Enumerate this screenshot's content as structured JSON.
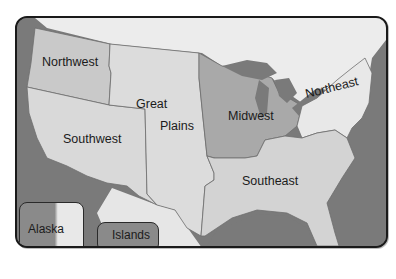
{
  "map": {
    "title": "United States Regions",
    "regions": [
      {
        "name": "Northwest",
        "fill": "#c9c9c9"
      },
      {
        "name": "Great",
        "fill": "#dcdcdc"
      },
      {
        "name": "Plains",
        "fill": "#dcdcdc"
      },
      {
        "name": "Southwest",
        "fill": "#d9d9d9"
      },
      {
        "name": "Midwest",
        "fill": "#a9a9a9"
      },
      {
        "name": "Northeast",
        "fill": "#e8e8e8"
      },
      {
        "name": "Southeast",
        "fill": "#d3d3d3"
      }
    ],
    "insets": [
      {
        "name": "Alaska"
      },
      {
        "name": "Islands"
      }
    ],
    "colors": {
      "water": "#7a7a7a",
      "land_outside": "#ececec",
      "border": "#1a1a1a",
      "region_line": "#6f6f6f"
    }
  }
}
